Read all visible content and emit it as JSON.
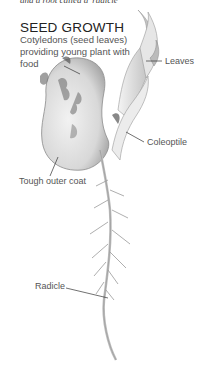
{
  "figure": {
    "top_caption_cropped": "and a root called a 'radicle'",
    "title": "SEED GROWTH",
    "subtitle": "Cotyledons (seed leaves) providing young plant with food",
    "labels": {
      "leaves": "Leaves",
      "coleoptile": "Coleoptile",
      "outer_coat": "Tough outer coat",
      "radicle": "Radicle"
    }
  }
}
